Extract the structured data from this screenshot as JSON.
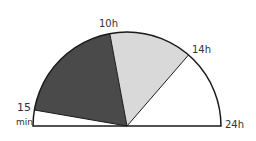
{
  "diagram": {
    "type": "semicircle-dial",
    "labels": {
      "start_top": "15",
      "start_bottom": "min",
      "mark_10h": "10h",
      "mark_14h": "14h",
      "end": "24h"
    },
    "segments": [
      {
        "name": "15min-to-10h",
        "fill": "#4a4a4a"
      },
      {
        "name": "10h-to-14h",
        "fill": "#d9d9d9"
      },
      {
        "name": "14h-to-24h",
        "fill": "#ffffff"
      },
      {
        "name": "0-to-15min",
        "fill": "#ffffff"
      }
    ],
    "stroke": "#1a1a1a"
  }
}
